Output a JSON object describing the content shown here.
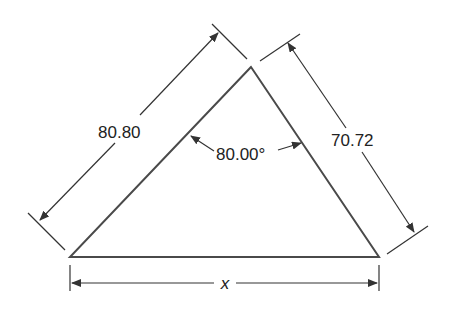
{
  "diagram": {
    "type": "triangle-dimension-drawing",
    "colors": {
      "line": "#4a4a4a",
      "text": "#222222",
      "background": "#ffffff"
    },
    "labels": {
      "left_side": "80.80",
      "right_side": "70.72",
      "apex_angle": "80.00°",
      "base": "x"
    },
    "vertices": {
      "apex": [
        251,
        67
      ],
      "bottom_left": [
        70,
        257
      ],
      "bottom_right": [
        379,
        257
      ]
    }
  }
}
